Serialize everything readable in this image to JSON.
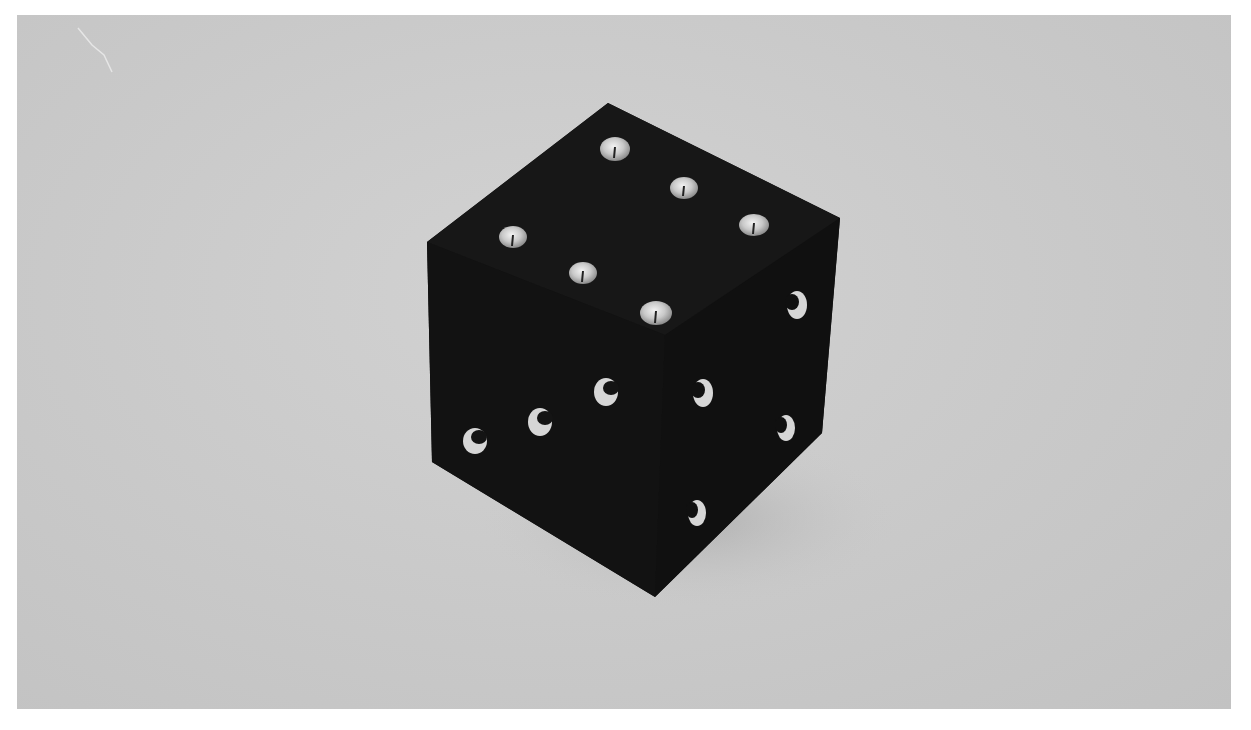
{
  "image": {
    "description": "Black-and-white photograph of a dark cube with metal studs on its faces, resting on a light gray surface",
    "subject": "studded-cube",
    "colors": {
      "background": "#c9c9c9",
      "border": "#ffffff",
      "cube": "#141414",
      "stud": "#d8d8d8"
    },
    "cube_vertices": {
      "top": [
        608,
        103
      ],
      "right": [
        840,
        218
      ],
      "bottom_right": [
        822,
        433
      ],
      "bottom": [
        655,
        597
      ],
      "bottom_left": [
        432,
        462
      ],
      "left": [
        427,
        242
      ]
    },
    "top_face_studs": [
      {
        "x": 615,
        "y": 149
      },
      {
        "x": 684,
        "y": 188
      },
      {
        "x": 754,
        "y": 225
      },
      {
        "x": 513,
        "y": 237
      },
      {
        "x": 583,
        "y": 273
      },
      {
        "x": 656,
        "y": 313
      }
    ],
    "side_studs": [
      {
        "x": 475,
        "y": 441
      },
      {
        "x": 540,
        "y": 422
      },
      {
        "x": 606,
        "y": 392
      },
      {
        "x": 703,
        "y": 393
      },
      {
        "x": 797,
        "y": 305
      },
      {
        "x": 786,
        "y": 428
      },
      {
        "x": 697,
        "y": 513
      }
    ]
  }
}
